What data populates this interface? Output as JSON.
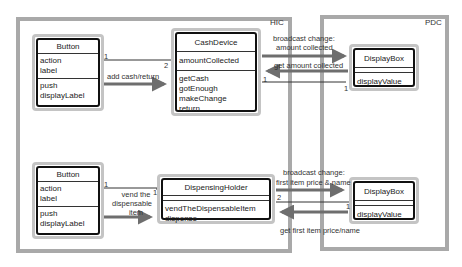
{
  "frames": {
    "hic": {
      "label": "HIC"
    },
    "pdc": {
      "label": "PDC"
    }
  },
  "classes": {
    "button_top": {
      "name": "Button",
      "attributes": [
        "action",
        "label"
      ],
      "operations": [
        "push",
        "displayLabel"
      ]
    },
    "cash_device": {
      "name": "CashDevice",
      "attributes": [
        "amountCollected"
      ],
      "operations": [
        "getCash",
        "gotEnough",
        "makeChange",
        "return"
      ]
    },
    "display_top": {
      "name": "DisplayBox",
      "attributes": [],
      "operations": [
        "displayValue"
      ]
    },
    "button_bottom": {
      "name": "Button",
      "attributes": [
        "action",
        "label"
      ],
      "operations": [
        "push",
        "displayLabel"
      ]
    },
    "dispensing_holder": {
      "name": "DispensingHolder",
      "attributes": [],
      "operations": [
        "vendTheDispensableItem",
        "dispense"
      ]
    },
    "display_bottom": {
      "name": "DisplayBox",
      "attributes": [],
      "operations": [
        "displayValue"
      ]
    }
  },
  "messages": {
    "add_cash": "add cash/return",
    "broadcast_amount_1": "broadcast change:",
    "broadcast_amount_2": "amount collected",
    "get_amount": "get amount collected",
    "vend_1": "vend the",
    "vend_2": "dispensable",
    "vend_3": "item",
    "broadcast_item_1": "broadcast change:",
    "broadcast_item_2": "first item price & name",
    "get_item": "get first item price/name"
  },
  "multiplicities": {
    "btn_cash_left": "1",
    "btn_cash_right": "2",
    "cash_disp_left": "1",
    "cash_disp_right": "1",
    "btn_hold_left": "1",
    "btn_hold_right": "1",
    "hold_disp_left": "2",
    "hold_disp_right": "1"
  },
  "colors": {
    "frame": "#a9a9a9",
    "arrow": "#6e6e6e",
    "class_border": "#111111"
  }
}
